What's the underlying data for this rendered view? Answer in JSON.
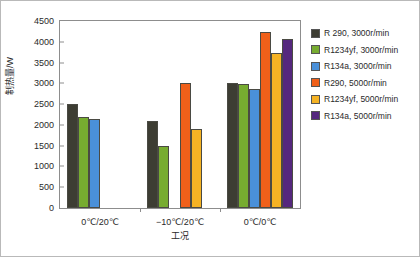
{
  "chart_data": {
    "type": "bar",
    "title": "",
    "xlabel": "工况",
    "ylabel": "制热量/W",
    "categories": [
      "0℃/20℃",
      "−10℃/20℃",
      "0℃/0℃"
    ],
    "ylim": [
      0,
      4500
    ],
    "yticks": [
      0,
      500,
      1000,
      1500,
      2000,
      2500,
      3000,
      3500,
      4000,
      4500
    ],
    "grid": false,
    "legend_position": "right",
    "series": [
      {
        "name": "R 290, 3000r/min",
        "color": "#3d3d33",
        "values": [
          2500,
          2100,
          3000
        ]
      },
      {
        "name": "R1234yf, 3000r/min",
        "color": "#77ac30",
        "values": [
          2180,
          1500,
          2990
        ]
      },
      {
        "name": "R134a, 3000r/min",
        "color": "#4a90d9",
        "values": [
          2140,
          null,
          2870
        ]
      },
      {
        "name": "R290, 5000r/min",
        "color": "#f0601a",
        "values": [
          null,
          3020,
          4230
        ]
      },
      {
        "name": "R1234yf, 5000r/min",
        "color": "#f5b324",
        "values": [
          null,
          1910,
          3720
        ]
      },
      {
        "name": "R134a, 5000r/min",
        "color": "#55287e",
        "values": [
          null,
          null,
          4070
        ]
      }
    ]
  },
  "legend": {
    "items": [
      {
        "label": "R 290, 3000r/min"
      },
      {
        "label": "R1234yf, 3000r/min"
      },
      {
        "label": "R134a, 3000r/min"
      },
      {
        "label": "R290, 5000r/min"
      },
      {
        "label": "R1234yf, 5000r/min"
      },
      {
        "label": "R134a, 5000r/min"
      }
    ]
  }
}
